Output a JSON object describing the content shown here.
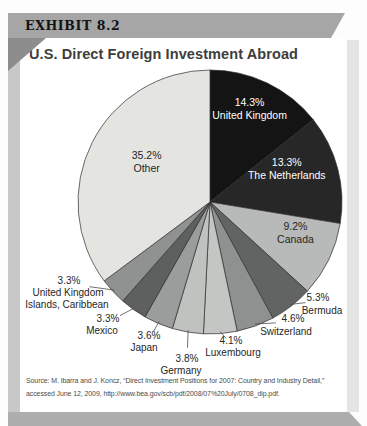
{
  "exhibit_label": "EXHIBIT 8.2",
  "title": "U.S. Direct Foreign Investment Abroad",
  "source": {
    "line1": "Source: M. Ibarra and J. Koncz, “Direct Investment Positions for 2007: Country and Industry Detail,”",
    "line2": "accessed June 12, 2009, http://www.bea.gov/scb/pdf/2008/07%20July/0708_dip.pdf."
  },
  "colors": {
    "banner_bg": "#a6a6a6",
    "left_shadow": "#c8c8c8",
    "right_shadow": "#e4e4e4",
    "bottom_shadow": "#aeaeae",
    "fold_shadow": "#8d8d8d",
    "panel_bg": "#ffffff",
    "slice_stroke": "#2e2e2e"
  },
  "chart_data": {
    "type": "pie",
    "title": "U.S. Direct Foreign Investment Abroad",
    "value_format": "percent",
    "start_angle_deg": 0,
    "direction": "clockwise",
    "legend_position": "none",
    "slices": [
      {
        "name": "United Kingdom",
        "pct": 14.3,
        "pct_label": "14.3%",
        "color": "#141414",
        "label_placement": "inside",
        "label_color": "#ffffff",
        "name_lines": [
          "United Kingdom"
        ]
      },
      {
        "name": "The Netherlands",
        "pct": 13.3,
        "pct_label": "13.3%",
        "color": "#272727",
        "label_placement": "inside",
        "label_color": "#ffffff",
        "name_lines": [
          "The Netherlands"
        ]
      },
      {
        "name": "Canada",
        "pct": 9.2,
        "pct_label": "9.2%",
        "color": "#b7bab9",
        "label_placement": "inside",
        "label_color": "#262626",
        "name_lines": [
          "Canada"
        ]
      },
      {
        "name": "Bermuda",
        "pct": 5.3,
        "pct_label": "5.3%",
        "color": "#626464",
        "label_placement": "outside",
        "label_color": "#262626",
        "name_lines": [
          "Bermuda"
        ]
      },
      {
        "name": "Switzerland",
        "pct": 4.6,
        "pct_label": "4.6%",
        "color": "#8f9191",
        "label_placement": "outside",
        "label_color": "#262626",
        "name_lines": [
          "Switzerland"
        ]
      },
      {
        "name": "Luxembourg",
        "pct": 4.1,
        "pct_label": "4.1%",
        "color": "#c4c6c4",
        "label_placement": "outside",
        "label_color": "#262626",
        "name_lines": [
          "Luxembourg"
        ]
      },
      {
        "name": "Germany",
        "pct": 3.8,
        "pct_label": "3.8%",
        "color": "#c0c2c0",
        "label_placement": "outside",
        "label_color": "#262626",
        "name_lines": [
          "Germany"
        ]
      },
      {
        "name": "Japan",
        "pct": 3.6,
        "pct_label": "3.6%",
        "color": "#9b9d9c",
        "label_placement": "outside",
        "label_color": "#262626",
        "name_lines": [
          "Japan"
        ]
      },
      {
        "name": "Mexico",
        "pct": 3.3,
        "pct_label": "3.3%",
        "color": "#5e6060",
        "label_placement": "outside",
        "label_color": "#262626",
        "name_lines": [
          "Mexico"
        ]
      },
      {
        "name": "United Kingdom Islands, Caribbean",
        "pct": 3.3,
        "pct_label": "3.3%",
        "color": "#909291",
        "label_placement": "outside",
        "label_color": "#262626",
        "name_lines": [
          "United Kingdom",
          "Islands, Caribbean"
        ]
      },
      {
        "name": "Other",
        "pct": 35.2,
        "pct_label": "35.2%",
        "color": "#e4e5e1",
        "label_placement": "inside",
        "label_color": "#262626",
        "name_lines": [
          "Other"
        ]
      }
    ]
  }
}
